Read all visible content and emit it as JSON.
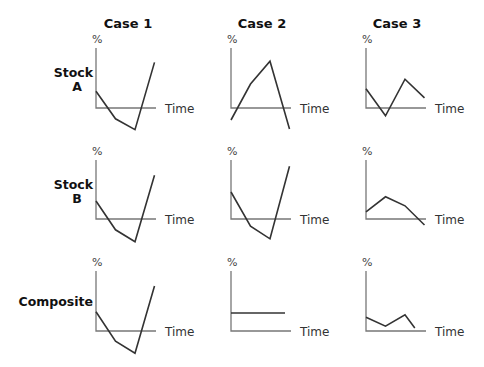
{
  "columns": [
    "Case 1",
    "Case 2",
    "Case 3"
  ],
  "rows": [
    {
      "label_lines": [
        "Stock",
        "A"
      ]
    },
    {
      "label_lines": [
        "Stock",
        "B"
      ]
    },
    {
      "label_lines": [
        "Composite"
      ]
    }
  ],
  "y_axis_label": "%",
  "x_axis_label": "Time",
  "colors": {
    "axis": "#777777",
    "line": "#333333",
    "text": "#111111"
  },
  "chart_data": {
    "type": "line",
    "title": "",
    "layout": "3x3 small multiples, rows = Stock A, Stock B, Composite; columns = Case 1, Case 2, Case 3",
    "xlabel": "Time",
    "ylabel": "%",
    "panels": [
      {
        "row": "Stock A",
        "col": "Case 1",
        "x": [
          0,
          1,
          2,
          3
        ],
        "y": [
          0.28,
          -0.18,
          -0.36,
          0.76
        ]
      },
      {
        "row": "Stock A",
        "col": "Case 2",
        "x": [
          0,
          1,
          2,
          3
        ],
        "y": [
          -0.2,
          0.4,
          0.78,
          -0.35
        ]
      },
      {
        "row": "Stock A",
        "col": "Case 3",
        "x": [
          0,
          1,
          2,
          3
        ],
        "y": [
          0.32,
          -0.13,
          0.48,
          0.17
        ]
      },
      {
        "row": "Stock B",
        "col": "Case 1",
        "x": [
          0,
          1,
          2,
          3
        ],
        "y": [
          0.3,
          -0.18,
          -0.38,
          0.73
        ]
      },
      {
        "row": "Stock B",
        "col": "Case 2",
        "x": [
          0,
          1,
          2,
          3
        ],
        "y": [
          0.45,
          -0.12,
          -0.33,
          0.88
        ]
      },
      {
        "row": "Stock B",
        "col": "Case 3",
        "x": [
          0,
          1,
          2,
          3
        ],
        "y": [
          0.12,
          0.37,
          0.22,
          -0.1
        ]
      },
      {
        "row": "Composite",
        "col": "Case 1",
        "x": [
          0,
          1,
          2,
          3
        ],
        "y": [
          0.32,
          -0.17,
          -0.37,
          0.75
        ]
      },
      {
        "row": "Composite",
        "col": "Case 2",
        "x": [
          0,
          3
        ],
        "y": [
          0.3,
          0.3
        ]
      },
      {
        "row": "Composite",
        "col": "Case 3",
        "x": [
          0,
          1,
          2,
          2.5
        ],
        "y": [
          0.23,
          0.08,
          0.27,
          0.05
        ]
      }
    ],
    "grid": false,
    "legend": null
  }
}
